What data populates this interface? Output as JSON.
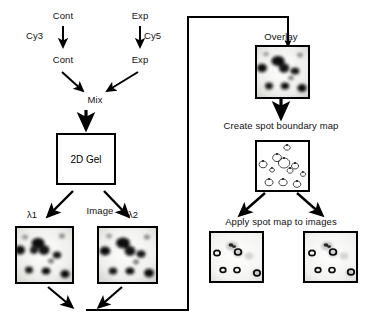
{
  "figure": {
    "background_color": "#ffffff",
    "line_color": "#000000"
  },
  "labels": {
    "cont_top": "Cont",
    "exp_top": "Exp",
    "cy3": "Cy3",
    "cy5": "Cy5",
    "cont_labeled": "Cont",
    "exp_labeled": "Exp",
    "mix": "Mix",
    "gel_box": "2D Gel",
    "image": "Image",
    "lambda1": "λ1",
    "lambda2": "λ2",
    "overlay": "Overlay",
    "create_spot_boundary_map": "Create spot boundary map",
    "apply_spot_map": "Apply spot map to images"
  },
  "nodes": [
    {
      "id": "cont-source",
      "label": "Cont",
      "x": 60,
      "y": 13,
      "type": "text"
    },
    {
      "id": "exp-source",
      "label": "Exp",
      "x": 137,
      "y": 13,
      "type": "text"
    },
    {
      "id": "cy3-tag",
      "label": "Cy3",
      "x": 28,
      "y": 33,
      "type": "text"
    },
    {
      "id": "cy5-tag",
      "label": "Cy5",
      "x": 145,
      "y": 33,
      "type": "text"
    },
    {
      "id": "cont-labeled",
      "label": "Cont",
      "x": 60,
      "y": 57,
      "type": "text"
    },
    {
      "id": "exp-labeled",
      "label": "Exp",
      "x": 137,
      "y": 57,
      "type": "text"
    },
    {
      "id": "mix",
      "label": "Mix",
      "x": 90,
      "y": 97,
      "type": "text"
    },
    {
      "id": "2d-gel",
      "label": "2D Gel",
      "x": 56,
      "y": 133,
      "w": 60,
      "h": 52,
      "type": "box"
    },
    {
      "id": "image-step",
      "label": "Image",
      "x": 85,
      "y": 208,
      "type": "text"
    },
    {
      "id": "gel-lambda1",
      "label": "λ1",
      "x": 15,
      "y": 226,
      "w": 55,
      "h": 54,
      "type": "gel"
    },
    {
      "id": "gel-lambda2",
      "label": "λ2",
      "x": 97,
      "y": 226,
      "w": 57,
      "h": 54,
      "type": "gel"
    },
    {
      "id": "gel-overlay",
      "label": "Overlay",
      "x": 255,
      "y": 45,
      "w": 51,
      "h": 50,
      "type": "gel"
    },
    {
      "id": "spot-boundary-map",
      "label": "Create spot boundary map",
      "x": 255,
      "y": 140,
      "w": 51,
      "h": 48,
      "type": "map"
    },
    {
      "id": "gel-applied-left",
      "label": "",
      "x": 209,
      "y": 231,
      "w": 51,
      "h": 48,
      "type": "gel"
    },
    {
      "id": "gel-applied-right",
      "label": "",
      "x": 303,
      "y": 231,
      "w": 51,
      "h": 48,
      "type": "gel"
    }
  ],
  "connections": [
    {
      "from": "cont-source",
      "to": "cont-labeled",
      "kind": "arrow-down",
      "tag": "Cy3"
    },
    {
      "from": "exp-source",
      "to": "exp-labeled",
      "kind": "arrow-down",
      "tag": "Cy5"
    },
    {
      "from": "cont-labeled",
      "to": "mix",
      "kind": "arrow-diagonal"
    },
    {
      "from": "exp-labeled",
      "to": "mix",
      "kind": "arrow-diagonal"
    },
    {
      "from": "mix",
      "to": "2d-gel",
      "kind": "arrow-down"
    },
    {
      "from": "2d-gel",
      "to": "gel-lambda1",
      "kind": "arrow-diagonal"
    },
    {
      "from": "2d-gel",
      "to": "gel-lambda2",
      "kind": "arrow-diagonal"
    },
    {
      "from": "gel-lambda1",
      "to": "merge-point",
      "kind": "arrow-diagonal"
    },
    {
      "from": "gel-lambda2",
      "to": "merge-point",
      "kind": "arrow-diagonal"
    },
    {
      "from": "merge-point",
      "to": "gel-overlay",
      "kind": "routed-line"
    },
    {
      "from": "gel-overlay",
      "to": "spot-boundary-map",
      "kind": "arrow-down"
    },
    {
      "from": "spot-boundary-map",
      "to": "gel-applied-left",
      "kind": "arrow-diagonal"
    },
    {
      "from": "spot-boundary-map",
      "to": "gel-applied-right",
      "kind": "arrow-diagonal"
    }
  ]
}
